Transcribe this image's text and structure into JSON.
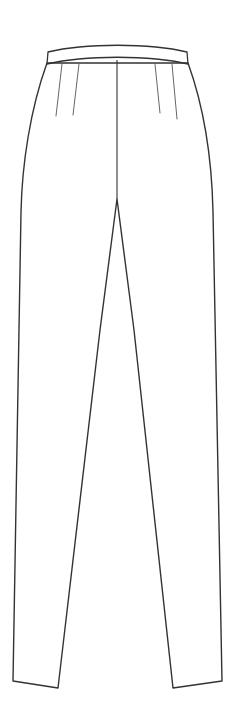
{
  "illustration": {
    "title": "Technical flat sketch of tailored trousers, front view",
    "garment_type": "trousers",
    "view": "front",
    "canvas": {
      "width": 234,
      "height": 723
    },
    "colors": {
      "background": "#ffffff",
      "fill": "#ffffff",
      "outline_stroke": "#333333",
      "detail_stroke": "#555555"
    },
    "stroke_widths": {
      "outline": 1.4,
      "waistband": 1.3,
      "center_front": 1.1,
      "dart": 0.9
    },
    "parts": [
      {
        "name": "waistband",
        "label": "Waistband",
        "path": "M 48 52 C 85 43 150 43 187 52 L 188 64 C 150 55 85 55 47 64 Z"
      },
      {
        "name": "trouser-body",
        "label": "Trouser body outline",
        "path": "M 47 63 C 30 110 22 165 21 212 L 13 681 L 58 688 L 100 330 L 117 199 L 134 330 L 173 688 L 222 681 L 213 212 C 212 165 205 110 188 63 Z"
      },
      {
        "name": "center-front-seam",
        "label": "Center front seam",
        "path": "M 117 60 L 117 199"
      },
      {
        "name": "dart-left-outer",
        "label": "Left outer dart",
        "path": "M 62 64 L 56 116"
      },
      {
        "name": "dart-left-inner",
        "label": "Left inner dart",
        "path": "M 79 64 L 73 115"
      },
      {
        "name": "dart-right-inner",
        "label": "Right inner dart",
        "path": "M 155 64 L 160 113"
      },
      {
        "name": "dart-right-outer",
        "label": "Right outer dart",
        "path": "M 172 64 L 177 119"
      },
      {
        "name": "left-leg-hem",
        "label": "Left leg hem",
        "path": "M 13 681 L 58 688"
      },
      {
        "name": "right-leg-hem",
        "label": "Right leg hem",
        "path": "M 173 688 L 222 681"
      }
    ]
  }
}
